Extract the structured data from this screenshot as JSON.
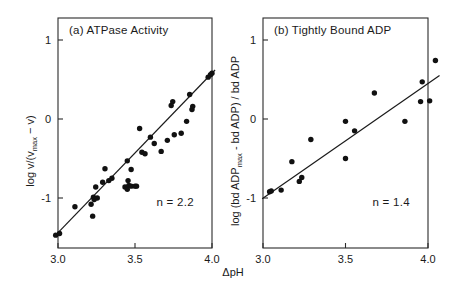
{
  "figure": {
    "x_axis_label": "ΔpH",
    "x_ticks": [
      "3.0",
      "3.5",
      "4.0"
    ],
    "y_ticks": [
      "1",
      "0",
      "-1"
    ]
  },
  "panels": [
    {
      "id": "panel-a",
      "title": "(a)  ATPase Activity",
      "label": "(a)",
      "name": "ATPase Activity",
      "y_axis_label": "log v/(v",
      "y_axis_label_sub": "max",
      "y_axis_label_tail": " − v)",
      "n_label": "n = 2.2",
      "n_value": 2.2
    },
    {
      "id": "panel-b",
      "title": "(b) Tightly Bound ADP",
      "label": "(b)",
      "name": "Tightly Bound ADP",
      "y_axis_label": "log (bd ADP",
      "y_axis_label_sub": "max",
      "y_axis_label_tail": " - bd ADP) / bd ADP",
      "n_label": "n = 1.4",
      "n_value": 1.4
    }
  ],
  "chart_data": [
    {
      "type": "scatter",
      "title": "(a)  ATPase Activity",
      "xlabel": "ΔpH",
      "ylabel": "log v/(vmax − v)",
      "xlim": [
        3.0,
        4.0
      ],
      "ylim": [
        -1.55,
        1.25
      ],
      "xticks": [
        3.0,
        3.5,
        4.0
      ],
      "yticks": [
        -1,
        0,
        1
      ],
      "grid": false,
      "legend": false,
      "annotation": "n = 2.2",
      "fit_line": {
        "slope": 2.2,
        "points": [
          [
            2.985,
            -1.47
          ],
          [
            4.02,
            0.62
          ]
        ]
      },
      "points": [
        [
          2.985,
          -1.47
        ],
        [
          3.01,
          -1.45
        ],
        [
          3.11,
          -1.11
        ],
        [
          3.215,
          -1.08
        ],
        [
          3.225,
          -1.23
        ],
        [
          3.23,
          -0.99
        ],
        [
          3.235,
          -1.02
        ],
        [
          3.245,
          -0.86
        ],
        [
          3.255,
          -1.0
        ],
        [
          3.29,
          -0.8
        ],
        [
          3.305,
          -0.63
        ],
        [
          3.33,
          -0.78
        ],
        [
          3.35,
          -0.75
        ],
        [
          3.435,
          -0.86
        ],
        [
          3.45,
          -0.89
        ],
        [
          3.455,
          -0.78
        ],
        [
          3.46,
          -0.84
        ],
        [
          3.475,
          -0.85
        ],
        [
          3.5,
          -0.85
        ],
        [
          3.51,
          -0.85
        ],
        [
          3.45,
          -0.53
        ],
        [
          3.475,
          -0.64
        ],
        [
          3.53,
          -0.12
        ],
        [
          3.545,
          -0.42
        ],
        [
          3.565,
          -0.44
        ],
        [
          3.6,
          -0.23
        ],
        [
          3.625,
          -0.31
        ],
        [
          3.67,
          -0.41
        ],
        [
          3.71,
          -0.27
        ],
        [
          3.735,
          0.17
        ],
        [
          3.745,
          0.22
        ],
        [
          3.755,
          -0.2
        ],
        [
          3.8,
          -0.18
        ],
        [
          3.835,
          -0.03
        ],
        [
          3.855,
          0.31
        ],
        [
          3.87,
          0.12
        ],
        [
          3.875,
          0.16
        ],
        [
          3.975,
          0.53
        ],
        [
          3.99,
          0.56
        ],
        [
          4.0,
          0.58
        ]
      ]
    },
    {
      "type": "scatter",
      "title": "(b) Tightly Bound ADP",
      "xlabel": "ΔpH",
      "ylabel": "log (bd ADPmax - bd ADP) / bd ADP",
      "xlim": [
        3.0,
        4.0
      ],
      "ylim": [
        -1.55,
        1.25
      ],
      "xticks": [
        3.0,
        3.5,
        4.0
      ],
      "yticks": [
        -1,
        0,
        1
      ],
      "grid": false,
      "legend": false,
      "annotation": "n = 1.4",
      "fit_line": {
        "slope": 1.4,
        "points": [
          [
            2.995,
            -1.01
          ],
          [
            4.07,
            0.55
          ]
        ]
      },
      "points": [
        [
          3.04,
          -0.92
        ],
        [
          3.05,
          -0.91
        ],
        [
          3.11,
          -0.9
        ],
        [
          3.175,
          -0.54
        ],
        [
          3.22,
          -0.79
        ],
        [
          3.235,
          -0.74
        ],
        [
          3.29,
          -0.26
        ],
        [
          3.5,
          -0.03
        ],
        [
          3.5,
          -0.5
        ],
        [
          3.555,
          -0.15
        ],
        [
          3.675,
          0.33
        ],
        [
          3.86,
          -0.03
        ],
        [
          3.955,
          0.22
        ],
        [
          3.965,
          0.47
        ],
        [
          4.01,
          0.23
        ],
        [
          4.045,
          0.74
        ]
      ]
    }
  ]
}
